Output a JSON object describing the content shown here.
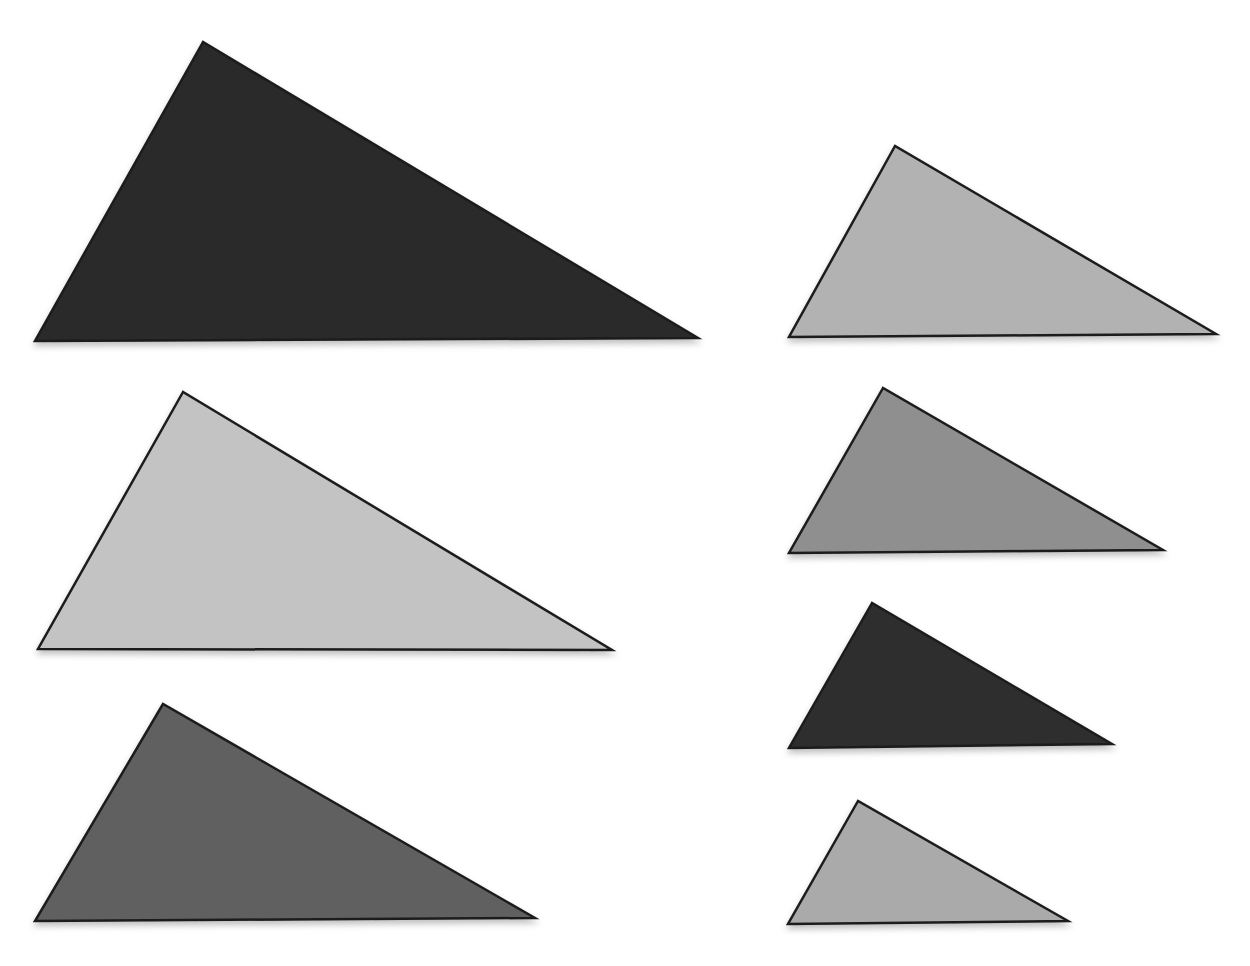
{
  "canvas": {
    "width": 1250,
    "height": 966,
    "background": "#ffffff"
  },
  "style": {
    "outline_color": "#1c1c1c",
    "outline_width": 2.5,
    "shadow_color": "#000000",
    "shadow_opacity": 0.25
  },
  "triangles": [
    {
      "id": "left-top-large-dark",
      "column": "left",
      "order": 1,
      "shade": "very-dark-gray",
      "fill": "#2a2a2a",
      "points": [
        [
          203,
          42
        ],
        [
          35,
          341
        ],
        [
          698,
          338
        ]
      ]
    },
    {
      "id": "left-middle-large-light",
      "column": "left",
      "order": 2,
      "shade": "light-gray",
      "fill": "#c3c3c3",
      "points": [
        [
          183,
          392
        ],
        [
          38,
          649
        ],
        [
          612,
          650
        ]
      ]
    },
    {
      "id": "left-bottom-large-medium",
      "column": "left",
      "order": 3,
      "shade": "medium-dark-gray",
      "fill": "#616161",
      "points": [
        [
          163,
          704
        ],
        [
          35,
          921
        ],
        [
          535,
          918
        ]
      ]
    },
    {
      "id": "right-first-small-light",
      "column": "right",
      "order": 1,
      "shade": "light-gray",
      "fill": "#b2b2b2",
      "points": [
        [
          895,
          146
        ],
        [
          789,
          337
        ],
        [
          1216,
          334
        ]
      ]
    },
    {
      "id": "right-second-small-medium",
      "column": "right",
      "order": 2,
      "shade": "medium-gray",
      "fill": "#8f8f8f",
      "points": [
        [
          883,
          388
        ],
        [
          789,
          553
        ],
        [
          1163,
          550
        ]
      ]
    },
    {
      "id": "right-third-small-dark",
      "column": "right",
      "order": 3,
      "shade": "dark-gray",
      "fill": "#2f2f2f",
      "points": [
        [
          872,
          603
        ],
        [
          789,
          748
        ],
        [
          1112,
          744
        ]
      ]
    },
    {
      "id": "right-fourth-small-light",
      "column": "right",
      "order": 4,
      "shade": "light-gray",
      "fill": "#aaaaaa",
      "points": [
        [
          858,
          801
        ],
        [
          788,
          924
        ],
        [
          1068,
          921
        ]
      ]
    }
  ]
}
